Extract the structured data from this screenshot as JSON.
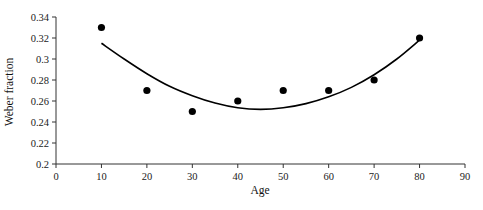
{
  "chart_data": {
    "type": "scatter",
    "title": "",
    "xlabel": "Age",
    "ylabel": "Weber fraction",
    "xlim": [
      0,
      90
    ],
    "ylim": [
      0.2,
      0.34
    ],
    "x_ticks": [
      0,
      10,
      20,
      30,
      40,
      50,
      60,
      70,
      80,
      90
    ],
    "y_ticks": [
      0.2,
      0.22,
      0.24,
      0.26,
      0.28,
      0.3,
      0.32,
      0.34
    ],
    "x_tick_labels": [
      "0",
      "10",
      "20",
      "30",
      "40",
      "50",
      "60",
      "70",
      "80",
      "90"
    ],
    "y_tick_labels": [
      "0.2",
      "0.22",
      "0.24",
      "0.26",
      "0.28",
      "0.3",
      "0.32",
      "0.34"
    ],
    "grid": false,
    "legend": null,
    "series": [
      {
        "name": "Observed Weber fraction",
        "type": "scatter",
        "marker": "filled-circle",
        "color": "#000000",
        "x": [
          10,
          20,
          30,
          40,
          50,
          60,
          70,
          80
        ],
        "y": [
          0.33,
          0.27,
          0.25,
          0.26,
          0.27,
          0.27,
          0.28,
          0.32
        ]
      },
      {
        "name": "Quadratic fit",
        "type": "line",
        "color": "#000000",
        "x": [
          10,
          15,
          20,
          25,
          30,
          35,
          40,
          45,
          50,
          55,
          60,
          65,
          70,
          75,
          80
        ],
        "y": [
          0.315,
          0.3,
          0.286,
          0.274,
          0.265,
          0.258,
          0.2535,
          0.252,
          0.2535,
          0.2575,
          0.264,
          0.273,
          0.285,
          0.3,
          0.318
        ]
      }
    ]
  },
  "axes": {
    "x_title": "Age",
    "y_title": "Weber fraction"
  }
}
